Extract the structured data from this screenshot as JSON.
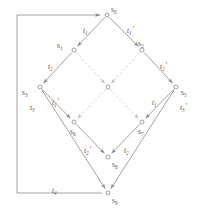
{
  "diagram": {
    "type": "state-transition-lattice",
    "title": "",
    "stroke_color": "#8a8a8a",
    "dashed_stroke_color": "#bbbbbb",
    "label_color": "#555555",
    "node_fill": "#ffffff",
    "nodes": [
      {
        "id": "s0",
        "label": "s",
        "sub": "0",
        "x": 107,
        "y": 15,
        "label_dx": 4,
        "label_dy": -10
      },
      {
        "id": "s1",
        "label": "s",
        "sub": "1",
        "x": 74,
        "y": 50,
        "label_dx": -17,
        "label_dy": -9
      },
      {
        "id": "s2",
        "label": "s",
        "sub": "2",
        "x": 142,
        "y": 50,
        "label_dx": -4,
        "label_dy": -11
      },
      {
        "id": "s3",
        "label": "s",
        "sub": "3",
        "x": 40,
        "y": 87,
        "label_dx": -18,
        "label_dy": 1
      },
      {
        "id": "s4",
        "label": "",
        "sub": "",
        "x": 108,
        "y": 87,
        "label_dx": 0,
        "label_dy": 0
      },
      {
        "id": "s5",
        "label": "s",
        "sub": "5",
        "x": 176,
        "y": 87,
        "label_dx": 5,
        "label_dy": 1
      },
      {
        "id": "s6",
        "label": "s",
        "sub": "6",
        "x": 74,
        "y": 122,
        "label_dx": -4,
        "label_dy": 5
      },
      {
        "id": "s7",
        "label": "s",
        "sub": "7",
        "x": 142,
        "y": 122,
        "label_dx": -4,
        "label_dy": 5
      },
      {
        "id": "s8",
        "label": "s",
        "sub": "8",
        "x": 108,
        "y": 157,
        "label_dx": 4,
        "label_dy": 3
      },
      {
        "id": "s9",
        "label": "s",
        "sub": "9",
        "x": 108,
        "y": 193,
        "label_dx": 4,
        "label_dy": 3
      }
    ],
    "edges": [
      {
        "id": "e-s0-s1",
        "from": "s0",
        "to": "s1",
        "style": "solid",
        "label": "t",
        "sub": "1",
        "prime": false,
        "label_x": 83,
        "label_y": 26
      },
      {
        "id": "e-s0-s2",
        "from": "s0",
        "to": "s2",
        "style": "solid",
        "label": "t",
        "sub": "1",
        "prime": true,
        "label_x": 127,
        "label_y": 26
      },
      {
        "id": "e-s1-s3",
        "from": "s1",
        "to": "s3",
        "style": "solid",
        "label": "t",
        "sub": "2",
        "prime": false,
        "label_x": 48,
        "label_y": 62
      },
      {
        "id": "e-s1-s4",
        "from": "s1",
        "to": "s4",
        "style": "dashed",
        "label": "",
        "sub": "",
        "prime": false,
        "label_x": 0,
        "label_y": 0
      },
      {
        "id": "e-s2-s4",
        "from": "s2",
        "to": "s4",
        "style": "dashed",
        "label": "",
        "sub": "",
        "prime": false,
        "label_x": 0,
        "label_y": 0
      },
      {
        "id": "e-s2-s5",
        "from": "s2",
        "to": "s5",
        "style": "solid",
        "label": "t",
        "sub": "2",
        "prime": true,
        "label_x": 160,
        "label_y": 62
      },
      {
        "id": "e-s3-s6",
        "from": "s3",
        "to": "s6",
        "style": "solid",
        "label": "t",
        "sub": "1",
        "prime": true,
        "label_x": 52,
        "label_y": 98
      },
      {
        "id": "e-s4-s6",
        "from": "s4",
        "to": "s6",
        "style": "dashed",
        "label": "",
        "sub": "",
        "prime": false,
        "label_x": 0,
        "label_y": 0
      },
      {
        "id": "e-s4-s7",
        "from": "s4",
        "to": "s7",
        "style": "dashed",
        "label": "",
        "sub": "",
        "prime": false,
        "label_x": 0,
        "label_y": 0
      },
      {
        "id": "e-s5-s7",
        "from": "s5",
        "to": "s7",
        "style": "solid",
        "label": "t",
        "sub": "1",
        "prime": false,
        "label_x": 152,
        "label_y": 98
      },
      {
        "id": "e-s6-s8",
        "from": "s6",
        "to": "s8",
        "style": "solid",
        "label": "t",
        "sub": "2",
        "prime": true,
        "label_x": 84,
        "label_y": 146
      },
      {
        "id": "e-s7-s8",
        "from": "s7",
        "to": "s8",
        "style": "solid",
        "label": "t",
        "sub": "2",
        "prime": false,
        "label_x": 124,
        "label_y": 146
      },
      {
        "id": "e-s3-s9",
        "from": "s3",
        "to": "s9",
        "style": "solid",
        "label": "t",
        "sub": "3",
        "prime": false,
        "label_x": 30,
        "label_y": 103
      },
      {
        "id": "e-s5-s9",
        "from": "s5",
        "to": "s9",
        "style": "solid",
        "label": "t",
        "sub": "3",
        "prime": true,
        "label_x": 180,
        "label_y": 103
      },
      {
        "id": "e-s9-s0",
        "from": "s9",
        "to": "s0",
        "style": "solid",
        "label": "t",
        "sub": "4",
        "prime": false,
        "label_x": 52,
        "label_y": 186,
        "routing": "feedback-left"
      }
    ],
    "feedback_edge": {
      "id": "e-feedback",
      "label": "t",
      "sub": "4",
      "description": "bottom-left feedback path from s9 back to s0",
      "path": "M 102 193 L 17 193 L 17 15 L 100 15"
    }
  }
}
